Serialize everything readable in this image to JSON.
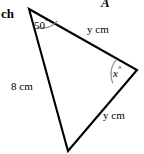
{
  "figure": {
    "background_color": "#ffffff",
    "stroke_color": "#000000",
    "arc_color": "#8c8c8c",
    "width": 144,
    "height": 154
  },
  "diagram": {
    "type": "triangle",
    "vertices": [
      {
        "name": "top-left",
        "x": 29,
        "y": 9
      },
      {
        "name": "right",
        "x": 137,
        "y": 70
      },
      {
        "name": "bottom",
        "x": 68,
        "y": 151
      }
    ],
    "corner_label": "ch",
    "clipped_glyph": "A",
    "angles": [
      {
        "name": "angle-top-left",
        "value": "50",
        "unit": "°",
        "text": "50°",
        "at_vertex": "top-left"
      },
      {
        "name": "angle-right",
        "value": "x",
        "unit": "°",
        "text": "x°",
        "at_vertex": "right"
      }
    ],
    "sides": [
      {
        "name": "side-left",
        "length_text": "8",
        "unit": "cm",
        "text": "8 cm",
        "between": [
          "top-left",
          "bottom"
        ]
      },
      {
        "name": "side-top",
        "length_text": "y",
        "unit": "cm",
        "text": "y cm",
        "between": [
          "top-left",
          "right"
        ]
      },
      {
        "name": "side-bottom-right",
        "length_text": "y",
        "unit": "cm",
        "text": "y cm",
        "between": [
          "right",
          "bottom"
        ]
      }
    ]
  }
}
